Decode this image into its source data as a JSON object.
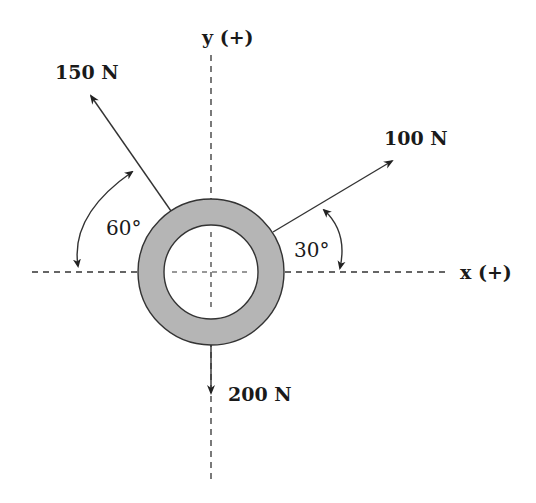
{
  "diagram": {
    "type": "free-body force diagram",
    "axes": {
      "x_label": "x (+)",
      "y_label": "y (+)"
    },
    "forces": [
      {
        "label": "150 N",
        "magnitude": 150,
        "unit": "N",
        "angle_label": "60°",
        "reference": "from negative x-axis, pointing up-left"
      },
      {
        "label": "100 N",
        "magnitude": 100,
        "unit": "N",
        "angle_label": "30°",
        "reference": "from positive x-axis, pointing up-right"
      },
      {
        "label": "200 N",
        "magnitude": 200,
        "unit": "N",
        "angle_label": "",
        "reference": "straight down, negative y"
      }
    ],
    "body": {
      "shape": "ring",
      "fill": "#b5b5b5",
      "stroke": "#333333"
    },
    "colors": {
      "line": "#333333",
      "ring_fill": "#b5b5b5",
      "background": "#ffffff"
    }
  }
}
